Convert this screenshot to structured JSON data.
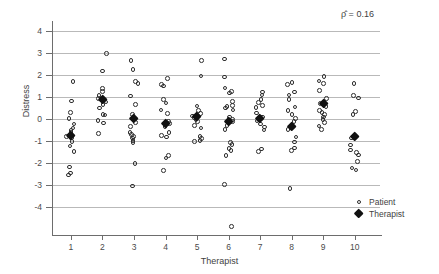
{
  "chart_data": {
    "type": "scatter",
    "title": "",
    "xlabel": "Therapist",
    "ylabel": "Distress",
    "xlim": [
      0.4,
      10.8
    ],
    "ylim": [
      -5.3,
      4.4
    ],
    "yticks": [
      4,
      3,
      2,
      1,
      0,
      -1,
      -2,
      -3,
      -4
    ],
    "ytick_labels": [
      "4",
      "3",
      "2",
      "1",
      "0",
      "-1",
      "-2",
      "-3",
      "-4"
    ],
    "xticks": [
      1,
      2,
      3,
      4,
      5,
      6,
      7,
      8,
      9,
      10
    ],
    "xtick_labels": [
      "1",
      "2",
      "3",
      "4",
      "5",
      "6",
      "7",
      "8",
      "9",
      "10"
    ],
    "grid": "horizontal",
    "legend_position": "right-bottom",
    "annotation": {
      "text": "ρ̂ =  0.16",
      "symbol": "rho-hat",
      "value": 0.16
    },
    "series": [
      {
        "name": "Patient",
        "marker": "open-circle",
        "color": "#2e2e2e",
        "points": [
          [
            1,
            1.7
          ],
          [
            1,
            0.82
          ],
          [
            1,
            0.3
          ],
          [
            1,
            0.02
          ],
          [
            1,
            -0.22
          ],
          [
            1,
            -0.4
          ],
          [
            1,
            -0.52
          ],
          [
            1,
            -0.6
          ],
          [
            1,
            -0.7
          ],
          [
            1,
            -0.78
          ],
          [
            1,
            -0.86
          ],
          [
            1,
            -1.02
          ],
          [
            1,
            -1.22
          ],
          [
            1,
            -1.46
          ],
          [
            1,
            -2.18
          ],
          [
            1,
            -2.44
          ],
          [
            1,
            -2.54
          ],
          [
            2,
            2.96
          ],
          [
            2,
            2.18
          ],
          [
            2,
            1.38
          ],
          [
            2,
            1.24
          ],
          [
            2,
            1.06
          ],
          [
            2,
            0.94
          ],
          [
            2,
            0.86
          ],
          [
            2,
            0.78
          ],
          [
            2,
            0.66
          ],
          [
            2,
            0.5
          ],
          [
            2,
            0.22
          ],
          [
            2,
            0.18
          ],
          [
            2,
            -0.06
          ],
          [
            2,
            -0.18
          ],
          [
            2,
            -0.66
          ],
          [
            3,
            2.66
          ],
          [
            3,
            2.24
          ],
          [
            3,
            1.7
          ],
          [
            3,
            1.62
          ],
          [
            3,
            1.04
          ],
          [
            3,
            0.66
          ],
          [
            3,
            0.2
          ],
          [
            3,
            0.06
          ],
          [
            3,
            -0.16
          ],
          [
            3,
            -0.34
          ],
          [
            3,
            -0.6
          ],
          [
            3,
            -0.7
          ],
          [
            3,
            -0.78
          ],
          [
            3,
            -0.86
          ],
          [
            3,
            -0.96
          ],
          [
            3,
            -1.06
          ],
          [
            3,
            -2.02
          ],
          [
            3,
            -3.04
          ],
          [
            4,
            1.84
          ],
          [
            4,
            1.58
          ],
          [
            4,
            1.5
          ],
          [
            4,
            0.9
          ],
          [
            4,
            0.72
          ],
          [
            4,
            0.42
          ],
          [
            4,
            0.26
          ],
          [
            4,
            -0.1
          ],
          [
            4,
            -0.2
          ],
          [
            4,
            -0.34
          ],
          [
            4,
            -0.6
          ],
          [
            4,
            -0.74
          ],
          [
            4,
            -0.82
          ],
          [
            4,
            -1.66
          ],
          [
            4,
            -1.76
          ],
          [
            4,
            -2.32
          ],
          [
            5,
            2.66
          ],
          [
            5,
            1.96
          ],
          [
            5,
            0.6
          ],
          [
            5,
            0.4
          ],
          [
            5,
            0.24
          ],
          [
            5,
            0.14
          ],
          [
            5,
            0.06
          ],
          [
            5,
            -0.02
          ],
          [
            5,
            -0.12
          ],
          [
            5,
            -0.3
          ],
          [
            5,
            -0.4
          ],
          [
            5,
            -0.8
          ],
          [
            5,
            -0.88
          ],
          [
            5,
            -0.96
          ],
          [
            5,
            -1.02
          ],
          [
            6,
            2.72
          ],
          [
            6,
            1.9
          ],
          [
            6,
            1.4
          ],
          [
            6,
            1.24
          ],
          [
            6,
            1.18
          ],
          [
            6,
            0.8
          ],
          [
            6,
            0.62
          ],
          [
            6,
            0.58
          ],
          [
            6,
            0.5
          ],
          [
            6,
            0.42
          ],
          [
            6,
            0.1
          ],
          [
            6,
            -0.02
          ],
          [
            6,
            -0.12
          ],
          [
            6,
            -0.28
          ],
          [
            6,
            -0.48
          ],
          [
            6,
            -1.06
          ],
          [
            6,
            -1.14
          ],
          [
            6,
            -1.34
          ],
          [
            6,
            -1.42
          ],
          [
            6,
            -1.66
          ],
          [
            6,
            -2.96
          ],
          [
            6,
            -4.86
          ],
          [
            7,
            1.22
          ],
          [
            7,
            1.1
          ],
          [
            7,
            0.9
          ],
          [
            7,
            0.76
          ],
          [
            7,
            0.62
          ],
          [
            7,
            0.52
          ],
          [
            7,
            0.28
          ],
          [
            7,
            0.1
          ],
          [
            7,
            -0.08
          ],
          [
            7,
            -0.22
          ],
          [
            7,
            -0.36
          ],
          [
            7,
            -0.5
          ],
          [
            7,
            -1.36
          ],
          [
            7,
            -1.48
          ],
          [
            8,
            1.66
          ],
          [
            8,
            1.56
          ],
          [
            8,
            1.22
          ],
          [
            8,
            1.1
          ],
          [
            8,
            0.88
          ],
          [
            8,
            0.54
          ],
          [
            8,
            0.38
          ],
          [
            8,
            0.22
          ],
          [
            8,
            0.02
          ],
          [
            8,
            -0.12
          ],
          [
            8,
            -0.46
          ],
          [
            8,
            -0.82
          ],
          [
            8,
            -1.04
          ],
          [
            8,
            -1.32
          ],
          [
            8,
            -1.42
          ],
          [
            8,
            -3.16
          ],
          [
            9,
            1.92
          ],
          [
            9,
            1.72
          ],
          [
            9,
            1.62
          ],
          [
            9,
            1.3
          ],
          [
            9,
            0.92
          ],
          [
            9,
            0.78
          ],
          [
            9,
            0.7
          ],
          [
            9,
            0.58
          ],
          [
            9,
            0.4
          ],
          [
            9,
            0.3
          ],
          [
            9,
            0.22
          ],
          [
            9,
            0.1
          ],
          [
            9,
            -0.02
          ],
          [
            9,
            -0.16
          ],
          [
            9,
            -0.32
          ],
          [
            9,
            -0.48
          ],
          [
            10,
            1.6
          ],
          [
            10,
            1.08
          ],
          [
            10,
            0.96
          ],
          [
            10,
            0.34
          ],
          [
            10,
            0.2
          ],
          [
            10,
            -0.86
          ],
          [
            10,
            -1.18
          ],
          [
            10,
            -1.4
          ],
          [
            10,
            -1.52
          ],
          [
            10,
            -1.62
          ],
          [
            10,
            -1.92
          ],
          [
            10,
            -2.22
          ],
          [
            10,
            -2.3
          ]
        ]
      },
      {
        "name": "Therapist",
        "marker": "filled-diamond",
        "color": "#111111",
        "points": [
          [
            1,
            -0.74
          ],
          [
            2,
            0.86
          ],
          [
            3,
            0.04
          ],
          [
            4,
            -0.2
          ],
          [
            5,
            0.12
          ],
          [
            6,
            -0.14
          ],
          [
            7,
            0.0
          ],
          [
            8,
            -0.34
          ],
          [
            9,
            0.7
          ],
          [
            10,
            -0.8
          ]
        ]
      }
    ],
    "legend": [
      {
        "label": "Patient",
        "marker": "open-circle"
      },
      {
        "label": "Therapist",
        "marker": "filled-diamond"
      }
    ]
  }
}
